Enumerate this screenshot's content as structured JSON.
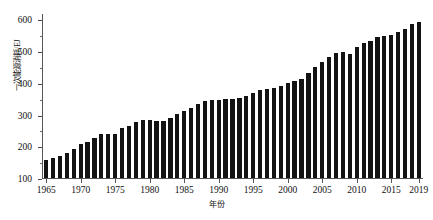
{
  "chart_data": {
    "type": "bar",
    "title": "",
    "xlabel": "年份",
    "ylabel": "一次能源消耗/EJ",
    "ylim": [
      100,
      620
    ],
    "xlim": [
      1964.4,
      2019.6
    ],
    "grid": false,
    "legend": null,
    "ytick_labels": [
      "100",
      "200",
      "300",
      "400",
      "500",
      "600"
    ],
    "ytick_values": [
      100,
      200,
      300,
      400,
      500,
      600
    ],
    "yminor_values": [
      150,
      250,
      350,
      450,
      550
    ],
    "xtick_labels": [
      "1965",
      "1970",
      "1975",
      "1980",
      "1985",
      "1990",
      "1995",
      "2000",
      "2005",
      "2010",
      "2015",
      "2019"
    ],
    "xtick_values": [
      1965,
      1970,
      1975,
      1980,
      1985,
      1990,
      1995,
      2000,
      2005,
      2010,
      2015,
      2019
    ],
    "bar_color": "#131313",
    "categories": [
      1965,
      1966,
      1967,
      1968,
      1969,
      1970,
      1971,
      1972,
      1973,
      1974,
      1975,
      1976,
      1977,
      1978,
      1979,
      1980,
      1981,
      1982,
      1983,
      1984,
      1985,
      1986,
      1987,
      1988,
      1989,
      1990,
      1991,
      1992,
      1993,
      1994,
      1995,
      1996,
      1997,
      1998,
      1999,
      2000,
      2001,
      2002,
      2003,
      2004,
      2005,
      2006,
      2007,
      2008,
      2009,
      2010,
      2011,
      2012,
      2013,
      2014,
      2015,
      2016,
      2017,
      2018,
      2019
    ],
    "values": [
      156,
      163,
      169,
      179,
      192,
      207,
      215,
      226,
      239,
      239,
      240,
      257,
      265,
      275,
      284,
      283,
      279,
      279,
      289,
      302,
      311,
      320,
      334,
      342,
      346,
      347,
      349,
      350,
      353,
      358,
      368,
      378,
      381,
      383,
      390,
      401,
      406,
      412,
      430,
      450,
      467,
      480,
      494,
      496,
      490,
      514,
      526,
      533,
      544,
      548,
      551,
      560,
      570,
      584,
      592
    ]
  }
}
